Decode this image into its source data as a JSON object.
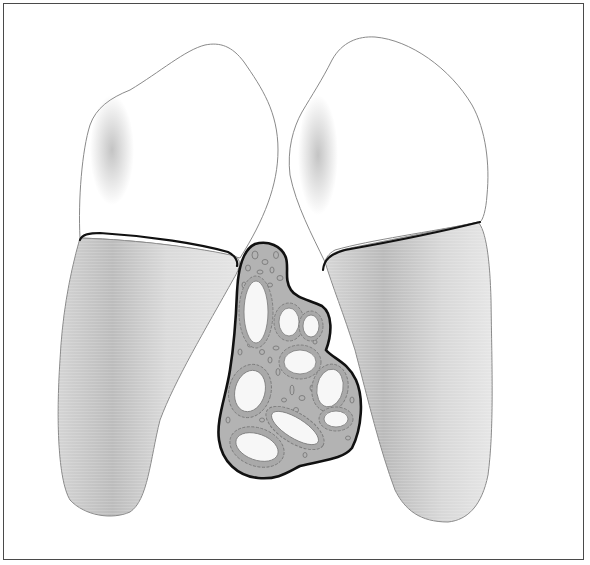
{
  "figure": {
    "elements": [
      {
        "id": "left-tooth",
        "label": "Left tooth",
        "parts": [
          "crown",
          "cemento-enamel junction",
          "root"
        ]
      },
      {
        "id": "right-tooth",
        "label": "Right tooth",
        "parts": [
          "crown",
          "cemento-enamel junction",
          "root"
        ]
      },
      {
        "id": "lesion",
        "label": "Interdental lesion with multiple epithelium-lined cystic spaces",
        "lumen_count": 9
      }
    ]
  },
  "colors": {
    "frame": "#4a4a4a",
    "crown_fill": "#ffffff",
    "crown_outline": "#8a8a8a",
    "crown_shade": "#bdbdbd",
    "root_fill": "#dcdcdc",
    "root_shade": "#b8b8b8",
    "cej_line": "#111111",
    "lesion_fill": "#b3b3b3",
    "lesion_outline": "#111111",
    "lumen_fill": "#f7f7f7",
    "cell_outline": "#7a7a7a"
  }
}
